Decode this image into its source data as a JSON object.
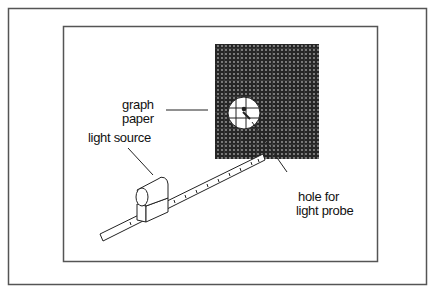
{
  "diagram": {
    "labels": {
      "graph_paper_line1": "graph",
      "graph_paper_line2": "paper",
      "light_source": "light source",
      "hole_line1": "hole for",
      "hole_line2": "light probe"
    },
    "colors": {
      "border": "#555555",
      "paper": "#2a2a2a",
      "grid_dot": "#9a9a9a"
    }
  }
}
